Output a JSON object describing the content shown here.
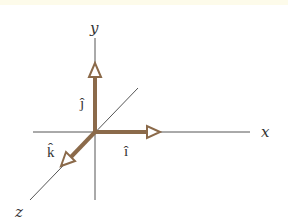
{
  "diagram": {
    "axes": [
      {
        "id": "x",
        "label": "x"
      },
      {
        "id": "y",
        "label": "y"
      },
      {
        "id": "z",
        "label": "z"
      }
    ],
    "vectors": [
      {
        "id": "i-hat",
        "label": "î",
        "base": "i",
        "along": "x"
      },
      {
        "id": "j-hat",
        "label": "ĵ",
        "base": "j",
        "along": "y"
      },
      {
        "id": "k-hat",
        "label": "k̂",
        "base": "k",
        "along": "z"
      }
    ],
    "colors": {
      "axis": "#555555",
      "vector": "#8b6a4a",
      "arrowhead_fill": "#ffffff",
      "text": "#333333"
    }
  }
}
